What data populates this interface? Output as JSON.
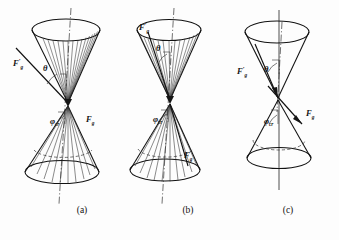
{
  "figure": {
    "background_color": "#fdfdfd",
    "ink_color": "#111111",
    "panel_count": 3
  },
  "symbols": {
    "force_primary": "F",
    "force_primary_sub": "g",
    "force_prime": "F",
    "force_prime_sub": "g",
    "prime_mark": "′",
    "theta": "θ",
    "phi": "φ",
    "phi_sub": "cr"
  },
  "panels": [
    {
      "id": "a",
      "caption": "(a)",
      "labels": {
        "force_prime": "F",
        "force_prime_sub": "g",
        "force_prime_prime": "′",
        "theta": "θ",
        "force": "F",
        "force_sub": "g",
        "phi": "φ",
        "phi_sub": "cr"
      },
      "description": "Double cone, wide upper nappe with dense generatrix lines, external oblique vector F′g at left",
      "axis_style": "dash-dot",
      "upper_cone": {
        "half_angle_deg": 36,
        "generatrix_count": 14
      },
      "lower_cone": {
        "half_angle_deg": 40,
        "generatrix_count": 12,
        "hidden_rim": true
      }
    },
    {
      "id": "b",
      "caption": "(b)",
      "labels": {
        "force_prime": "F",
        "force_prime_sub": "g",
        "force_prime_prime": "′",
        "theta": "θ",
        "force": "F",
        "force_sub": "g",
        "phi": "φ",
        "phi_sub": "cr"
      },
      "description": "Double cone, vector F′g lies inside the upper nappe, Fg inside lower nappe",
      "axis_style": "dash-dot",
      "upper_cone": {
        "half_angle_deg": 33,
        "generatrix_count": 14
      },
      "lower_cone": {
        "half_angle_deg": 38,
        "generatrix_count": 12,
        "hidden_rim": true
      }
    },
    {
      "id": "c",
      "caption": "(c)",
      "labels": {
        "force_prime": "F",
        "force_prime_sub": "g",
        "force_prime_prime": "′",
        "theta": "θ",
        "force": "F",
        "force_sub": "g",
        "phi": "φ",
        "phi_sub": "cr"
      },
      "description": "Double cone drawn as plain outlines without generatrix lines; F′g and Fg arrows cross at apex",
      "axis_style": "solid",
      "upper_cone": {
        "half_angle_deg": 30,
        "generatrix_count": 0
      },
      "lower_cone": {
        "half_angle_deg": 32,
        "generatrix_count": 0,
        "hidden_rim": true
      }
    }
  ]
}
